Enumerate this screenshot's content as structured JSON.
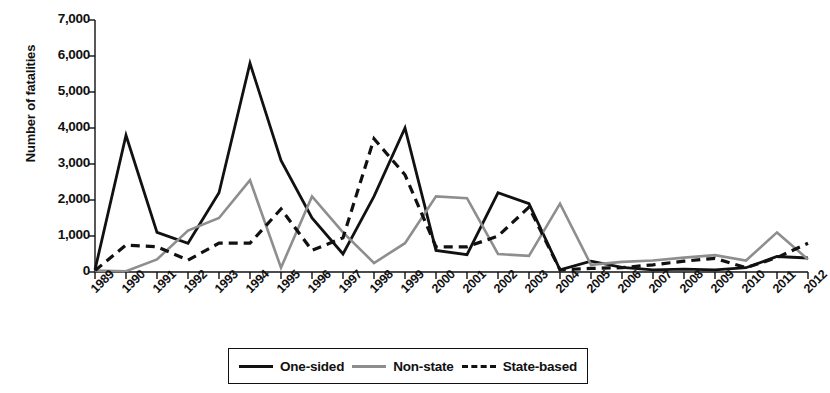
{
  "chart_data": {
    "type": "line",
    "title": "",
    "xlabel": "",
    "ylabel": "Number of fatalities",
    "ylim": [
      0,
      7000
    ],
    "ytick_labels": [
      "0",
      "1,000",
      "2,000",
      "3,000",
      "4,000",
      "5,000",
      "6,000",
      "7,000"
    ],
    "ytick_values": [
      0,
      1000,
      2000,
      3000,
      4000,
      5000,
      6000,
      7000
    ],
    "grid": false,
    "legend_position": "bottom",
    "categories": [
      "1989",
      "1990",
      "1991",
      "1992",
      "1993",
      "1994",
      "1995",
      "1996",
      "1997",
      "1998",
      "1999",
      "2000",
      "2001",
      "2002",
      "2003",
      "2004",
      "2005",
      "2006",
      "2007",
      "2008",
      "2009",
      "2010",
      "2011",
      "2012"
    ],
    "series": [
      {
        "name": "One-sided",
        "color": "#111111",
        "style": "solid",
        "values": [
          60,
          3800,
          1100,
          800,
          2200,
          5800,
          3100,
          1500,
          500,
          2100,
          4000,
          600,
          480,
          2200,
          1900,
          60,
          300,
          130,
          60,
          80,
          60,
          120,
          430,
          390
        ]
      },
      {
        "name": "Non-state",
        "color": "#8e8e8e",
        "style": "solid",
        "values": [
          40,
          20,
          350,
          1150,
          1500,
          2550,
          120,
          2100,
          1100,
          250,
          800,
          2100,
          2050,
          500,
          450,
          1900,
          200,
          280,
          320,
          400,
          470,
          320,
          1100,
          350
        ]
      },
      {
        "name": "State-based",
        "color": "#111111",
        "style": "dashed",
        "values": [
          40,
          750,
          700,
          330,
          800,
          800,
          1750,
          600,
          950,
          3700,
          2700,
          700,
          700,
          1000,
          1800,
          60,
          100,
          120,
          200,
          300,
          380,
          120,
          400,
          800
        ]
      }
    ]
  },
  "legend": {
    "items": [
      {
        "label": "One-sided",
        "swatch": "solid-black-line"
      },
      {
        "label": "Non-state",
        "swatch": "solid-gray-line"
      },
      {
        "label": "State-based",
        "swatch": "dashed-black-line"
      }
    ]
  }
}
